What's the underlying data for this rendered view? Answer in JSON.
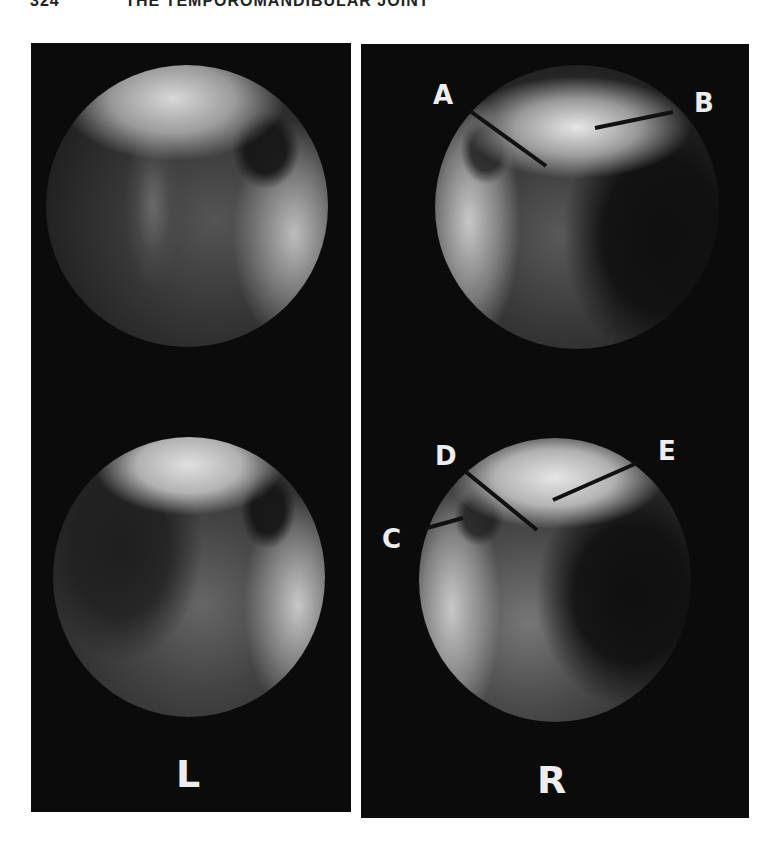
{
  "header": {
    "page_number": "324",
    "running_title": "THE TEMPOROMANDIBULAR JOINT"
  },
  "figure": {
    "panels": [
      {
        "side_label": "L",
        "views": [
          "upper arthroscopic view",
          "lower arthroscopic view"
        ]
      },
      {
        "side_label": "R",
        "views": [
          "upper arthroscopic view",
          "lower arthroscopic view"
        ]
      }
    ],
    "annotations": {
      "a": "A",
      "b": "B",
      "c": "C",
      "d": "D",
      "e": "E"
    }
  }
}
